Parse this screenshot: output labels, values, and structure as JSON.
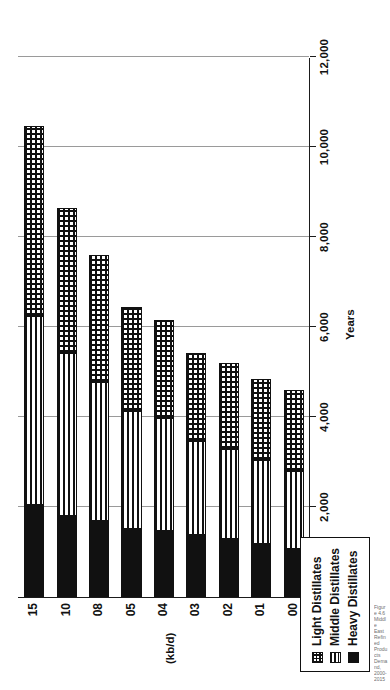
{
  "chart_data": {
    "type": "bar",
    "subtype": "stacked-horizontal",
    "orientation": "rotated-90-ccw",
    "title": "",
    "xlabel": "Years",
    "ylabel": "(kb/d)",
    "ylim": [
      0,
      12000
    ],
    "grid": true,
    "legend_position": "top-left",
    "categories": [
      "00",
      "01",
      "02",
      "03",
      "04",
      "05",
      "08",
      "10",
      "15"
    ],
    "ticks": [
      "0",
      "2,000",
      "4,000",
      "6,000",
      "8,000",
      "10,000",
      "12,000"
    ],
    "tick_values": [
      0,
      2000,
      4000,
      6000,
      8000,
      10000,
      12000
    ],
    "series": [
      {
        "name": "Heavy Distillates",
        "values": [
          1080,
          1190,
          1310,
          1390,
          1490,
          1530,
          1720,
          1820,
          2070
        ]
      },
      {
        "name": "Middle Distillates",
        "values": [
          1730,
          1850,
          1980,
          2080,
          2480,
          2600,
          3060,
          3600,
          4180
        ]
      },
      {
        "name": "Light Distillates",
        "values": [
          1790,
          1810,
          1910,
          1960,
          2180,
          2320,
          2820,
          3230,
          4220
        ]
      }
    ],
    "totals": [
      4600,
      4850,
      5200,
      5430,
      6150,
      6450,
      7600,
      8650,
      10470
    ]
  },
  "legend": {
    "items": [
      {
        "label": "Light Distillates",
        "icon": "grid-hatch-swatch"
      },
      {
        "label": "Middle Distillates",
        "icon": "horizontal-line-swatch"
      },
      {
        "label": "Heavy Distillates",
        "icon": "solid-black-swatch"
      }
    ]
  },
  "axes": {
    "value_axis_title": "(kb/d)",
    "category_axis_title": "Years"
  },
  "caption": {
    "text": "Figure 4.6 Middle East Refined Products Demand, 2000-2015"
  }
}
